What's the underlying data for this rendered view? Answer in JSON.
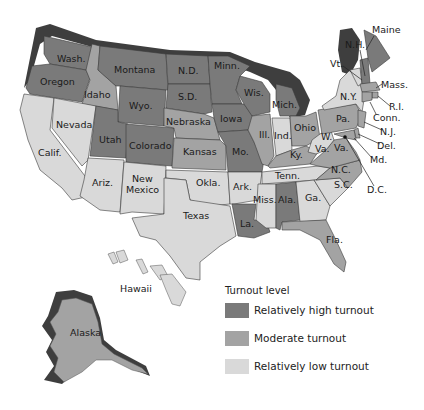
{
  "map": {
    "legend": {
      "title": "Turnout level",
      "items": [
        {
          "key": "high",
          "label": "Relatively high turnout",
          "color": "#7a7a7a"
        },
        {
          "key": "moderate",
          "label": "Moderate turnout",
          "color": "#a3a3a3"
        },
        {
          "key": "low",
          "label": "Relatively low turnout",
          "color": "#d9d9d9"
        }
      ]
    },
    "shadow_color": "#3e3e3e",
    "labels": {
      "wash": "Wash.",
      "oregon": "Oregon",
      "calif": "Calif.",
      "idaho": "Idaho",
      "nevada": "Nevada",
      "montana": "Montana",
      "wyo": "Wyo.",
      "utah": "Utah",
      "ariz": "Ariz.",
      "colorado": "Colorado",
      "new": "New",
      "mexico": "Mexico",
      "nd": "N.D.",
      "sd": "S.D.",
      "nebraska": "Nebraska",
      "kansas": "Kansas",
      "okla": "Okla.",
      "texas": "Texas",
      "minn": "Minn.",
      "iowa": "Iowa",
      "mo": "Mo.",
      "ark": "Ark.",
      "la": "La.",
      "wis": "Wis.",
      "ill": "Ill.",
      "mich": "Mich.",
      "ind": "Ind.",
      "ohio": "Ohio",
      "ky": "Ky.",
      "tenn": "Tenn.",
      "miss": "Miss.",
      "ala": "Ala.",
      "ga": "Ga.",
      "fla": "Fla.",
      "sc": "S.C.",
      "nc": "N.C.",
      "va": "Va.",
      "w": "W.",
      "wva": "Va.",
      "pa": "Pa.",
      "ny": "N.Y.",
      "vt": "Vt.",
      "nh": "N.H.",
      "maine": "Maine",
      "mass": "Mass.",
      "ri": "R.I.",
      "conn": "Conn.",
      "nj": "N.J.",
      "del": "Del.",
      "md": "Md.",
      "dc": "D.C.",
      "hawaii": "Hawaii",
      "alaska": "Alaska"
    },
    "states": [
      {
        "name": "Washington",
        "level": "high"
      },
      {
        "name": "Oregon",
        "level": "high"
      },
      {
        "name": "California",
        "level": "low"
      },
      {
        "name": "Idaho",
        "level": "moderate"
      },
      {
        "name": "Nevada",
        "level": "low"
      },
      {
        "name": "Montana",
        "level": "high"
      },
      {
        "name": "Wyoming",
        "level": "high"
      },
      {
        "name": "Utah",
        "level": "high"
      },
      {
        "name": "Arizona",
        "level": "low"
      },
      {
        "name": "Colorado",
        "level": "high"
      },
      {
        "name": "New Mexico",
        "level": "low"
      },
      {
        "name": "North Dakota",
        "level": "high"
      },
      {
        "name": "South Dakota",
        "level": "high"
      },
      {
        "name": "Nebraska",
        "level": "moderate"
      },
      {
        "name": "Kansas",
        "level": "moderate"
      },
      {
        "name": "Oklahoma",
        "level": "low"
      },
      {
        "name": "Texas",
        "level": "low"
      },
      {
        "name": "Minnesota",
        "level": "high"
      },
      {
        "name": "Iowa",
        "level": "high"
      },
      {
        "name": "Missouri",
        "level": "high"
      },
      {
        "name": "Arkansas",
        "level": "low"
      },
      {
        "name": "Louisiana",
        "level": "high"
      },
      {
        "name": "Wisconsin",
        "level": "high"
      },
      {
        "name": "Illinois",
        "level": "moderate"
      },
      {
        "name": "Michigan",
        "level": "high"
      },
      {
        "name": "Indiana",
        "level": "low"
      },
      {
        "name": "Ohio",
        "level": "moderate"
      },
      {
        "name": "Kentucky",
        "level": "moderate"
      },
      {
        "name": "Tennessee",
        "level": "low"
      },
      {
        "name": "Mississippi",
        "level": "low"
      },
      {
        "name": "Alabama",
        "level": "high"
      },
      {
        "name": "Georgia",
        "level": "low"
      },
      {
        "name": "Florida",
        "level": "moderate"
      },
      {
        "name": "South Carolina",
        "level": "low"
      },
      {
        "name": "North Carolina",
        "level": "moderate"
      },
      {
        "name": "Virginia",
        "level": "moderate"
      },
      {
        "name": "West Virginia",
        "level": "low"
      },
      {
        "name": "Pennsylvania",
        "level": "moderate"
      },
      {
        "name": "New York",
        "level": "low"
      },
      {
        "name": "Vermont",
        "level": "low"
      },
      {
        "name": "New Hampshire",
        "level": "high"
      },
      {
        "name": "Maine",
        "level": "high"
      },
      {
        "name": "Massachusetts",
        "level": "moderate"
      },
      {
        "name": "Rhode Island",
        "level": "moderate"
      },
      {
        "name": "Connecticut",
        "level": "moderate"
      },
      {
        "name": "New Jersey",
        "level": "moderate"
      },
      {
        "name": "Delaware",
        "level": "moderate"
      },
      {
        "name": "Maryland",
        "level": "moderate"
      },
      {
        "name": "District of Columbia",
        "level": "high"
      },
      {
        "name": "Hawaii",
        "level": "low"
      },
      {
        "name": "Alaska",
        "level": "moderate"
      }
    ]
  }
}
